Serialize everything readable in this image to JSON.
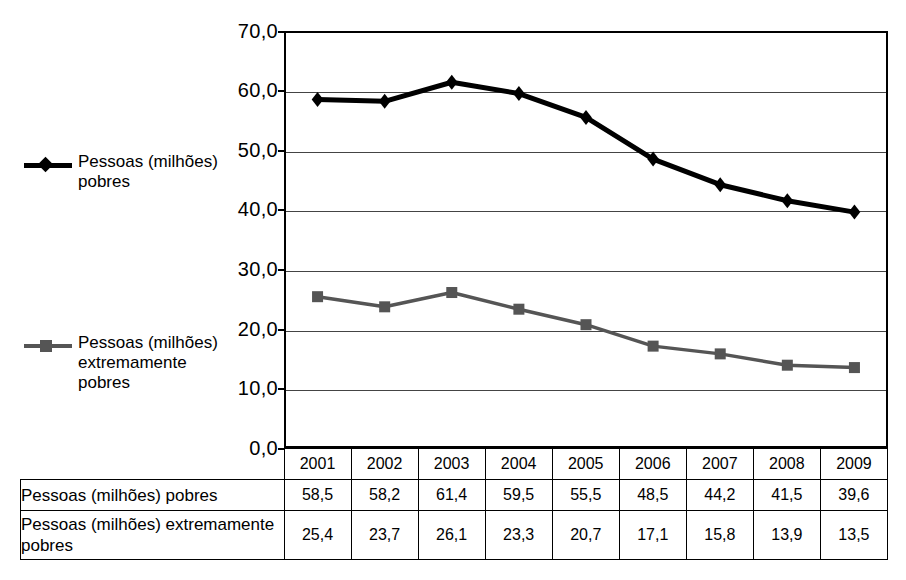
{
  "chart_data": {
    "type": "line",
    "title": "",
    "xlabel": "",
    "ylabel": "",
    "categories": [
      "2001",
      "2002",
      "2003",
      "2004",
      "2005",
      "2006",
      "2007",
      "2008",
      "2009"
    ],
    "series": [
      {
        "name": "Pessoas (milhões) pobres",
        "marker": "diamond",
        "color": "#000000",
        "values": [
          58.5,
          58.2,
          61.4,
          59.5,
          55.5,
          48.5,
          44.2,
          41.5,
          39.6
        ]
      },
      {
        "name": "Pessoas (milhões) extremamente pobres",
        "marker": "square",
        "color": "#555555",
        "values": [
          25.4,
          23.7,
          26.1,
          23.3,
          20.7,
          17.1,
          15.8,
          13.9,
          13.5
        ]
      }
    ],
    "ylim": [
      0,
      70
    ],
    "ytick_step": 10,
    "ytick_labels": [
      "70,0",
      "60,0",
      "50,0",
      "40,0",
      "30,0",
      "20,0",
      "10,0",
      "0,0"
    ],
    "ytick_values": [
      70,
      60,
      50,
      40,
      30,
      20,
      10,
      0
    ],
    "grid": true,
    "legend_position": "left"
  },
  "legend": {
    "entries": [
      {
        "label": "Pessoas (milhões) pobres",
        "marker": "diamond-marker",
        "color": "#000000"
      },
      {
        "label": "Pessoas (milhões) extremamente pobres",
        "marker": "square-marker",
        "color": "#555555"
      }
    ]
  },
  "table": {
    "header": [
      "",
      "2001",
      "2002",
      "2003",
      "2004",
      "2005",
      "2006",
      "2007",
      "2008",
      "2009"
    ],
    "rows": [
      {
        "label": "Pessoas (milhões) pobres",
        "values": [
          "58,5",
          "58,2",
          "61,4",
          "59,5",
          "55,5",
          "48,5",
          "44,2",
          "41,5",
          "39,6"
        ]
      },
      {
        "label": "Pessoas (milhões) extremamente pobres",
        "values": [
          "25,4",
          "23,7",
          "26,1",
          "23,3",
          "20,7",
          "17,1",
          "15,8",
          "13,9",
          "13,5"
        ]
      }
    ]
  }
}
